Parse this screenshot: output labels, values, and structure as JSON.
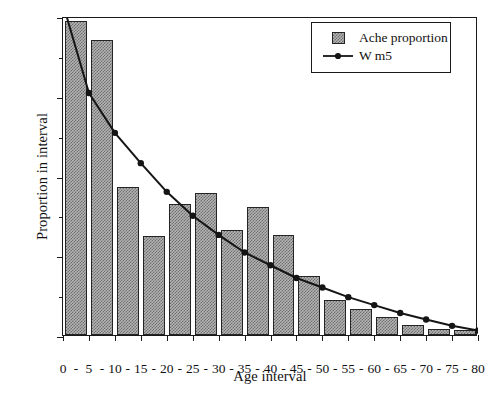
{
  "chart_data": {
    "type": "bar",
    "title": "",
    "xlabel": "Age interval",
    "ylabel": "Proportion in interval",
    "ylim": [
      0.0,
      0.2
    ],
    "yticks": [
      0.0,
      0.05,
      0.1,
      0.15,
      0.2
    ],
    "ytick_labels": [
      "0.00",
      "0.05",
      "0.10",
      "0.15",
      "0.20"
    ],
    "yminor_ticks": [
      0.025,
      0.075,
      0.125,
      0.175
    ],
    "grid": false,
    "legend_position": "top-right",
    "boundaries": [
      0,
      5,
      10,
      15,
      20,
      25,
      30,
      35,
      40,
      45,
      50,
      55,
      60,
      65,
      70,
      75,
      80
    ],
    "xtick_labels": [
      "0",
      "5",
      "10",
      "15",
      "20",
      "25",
      "30",
      "35",
      "40",
      "45",
      "50",
      "55",
      "60",
      "65",
      "70",
      "75",
      "80"
    ],
    "xtick_separator": "-",
    "categories": [
      "0 - 5",
      "5 - 10",
      "10 - 15",
      "15 - 20",
      "20 - 25",
      "25 - 30",
      "30 - 35",
      "35 - 40",
      "40 - 45",
      "45 - 50",
      "50 - 55",
      "55 - 60",
      "60 - 65",
      "65 - 70",
      "70 - 75",
      "75 - 80"
    ],
    "series": [
      {
        "name": "Ache proportion",
        "kind": "bar",
        "color": "#b4b4b4",
        "edge_color": "#242424",
        "values": [
          0.197,
          0.185,
          0.093,
          0.062,
          0.082,
          0.089,
          0.066,
          0.08,
          0.063,
          0.037,
          0.022,
          0.016,
          0.011,
          0.006,
          0.004,
          0.003
        ]
      },
      {
        "name": "W m5",
        "kind": "line",
        "color": "#151515",
        "marker": "filled-circle",
        "x": [
          5,
          10,
          15,
          20,
          25,
          30,
          35,
          40,
          45,
          50,
          55,
          60,
          65,
          70,
          75,
          80
        ],
        "values": [
          0.153,
          0.128,
          0.109,
          0.091,
          0.076,
          0.064,
          0.053,
          0.045,
          0.037,
          0.031,
          0.025,
          0.02,
          0.015,
          0.011,
          0.007,
          0.004
        ],
        "start_offscreen_top": true
      }
    ]
  },
  "legend": {
    "items": [
      {
        "label": "Ache proportion",
        "key": "swatch"
      },
      {
        "label": "W m5",
        "key": "line-marker"
      }
    ]
  }
}
